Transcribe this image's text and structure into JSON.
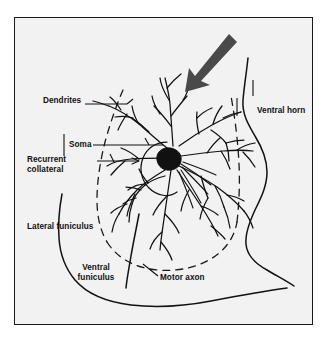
{
  "figure": {
    "type": "anatomical-diagram",
    "background_color": "#f2f2f2",
    "page_color": "#ffffff",
    "frame_color": "#1a1a1a",
    "ink_color": "#111111",
    "arrow_color": "#4a4a4a",
    "labels": {
      "dendrites": "Dendrites",
      "soma": "Soma",
      "recurrent_collateral": "Recurrent collateral",
      "lateral_funiculus": "Lateral funiculus",
      "ventral_funiculus": "Ventral funiculus",
      "motor_axon": "Motor axon",
      "ventral_horn": "Ventral horn"
    },
    "annotations": {
      "pointer_arrow": "thick-down-left-arrow"
    }
  }
}
